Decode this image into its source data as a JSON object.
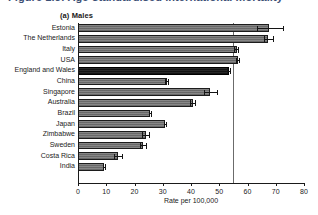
{
  "figure": {
    "title": "Figure 1.3: Age-standardised international mortality",
    "panel_label": "(a) Males"
  },
  "chart_data": {
    "type": "bar",
    "orientation": "horizontal",
    "title": "(a) Males",
    "xlabel": "Rate per 100,000",
    "ylabel": "",
    "xlim": [
      0,
      80
    ],
    "xticks": [
      0,
      10,
      20,
      30,
      40,
      50,
      60,
      70,
      80
    ],
    "grid": false,
    "legend": null,
    "reference_line": {
      "value": 55,
      "label": ""
    },
    "categories": [
      "Estonia",
      "The Netherlands",
      "Italy",
      "USA",
      "England and Wales",
      "China",
      "Singapore",
      "Australia",
      "Brazil",
      "Japan",
      "Zimbabwe",
      "Sweden",
      "Costa Rica",
      "India"
    ],
    "values": [
      67.6,
      67.3,
      56.2,
      56.6,
      53.4,
      31.5,
      46.9,
      40.7,
      25.6,
      30.9,
      23.9,
      23.0,
      14.1,
      9.3
    ],
    "errors_low": [
      63.4,
      65.7,
      55.3,
      56.0,
      52.8,
      30.9,
      44.5,
      39.8,
      25.2,
      30.3,
      22.6,
      21.8,
      12.6,
      8.9
    ],
    "errors_high": [
      72.9,
      69.5,
      57.1,
      57.3,
      54.1,
      32.3,
      49.5,
      41.8,
      26.1,
      31.6,
      25.4,
      24.4,
      16.0,
      9.9
    ],
    "highlighted_category": "England and Wales"
  },
  "colors": {
    "bar": "#6f6f6f",
    "bar_highlight": "#171717",
    "axis": "#1a1a1a",
    "reference_line": "#6b6b6b",
    "title": "#1f3864"
  }
}
